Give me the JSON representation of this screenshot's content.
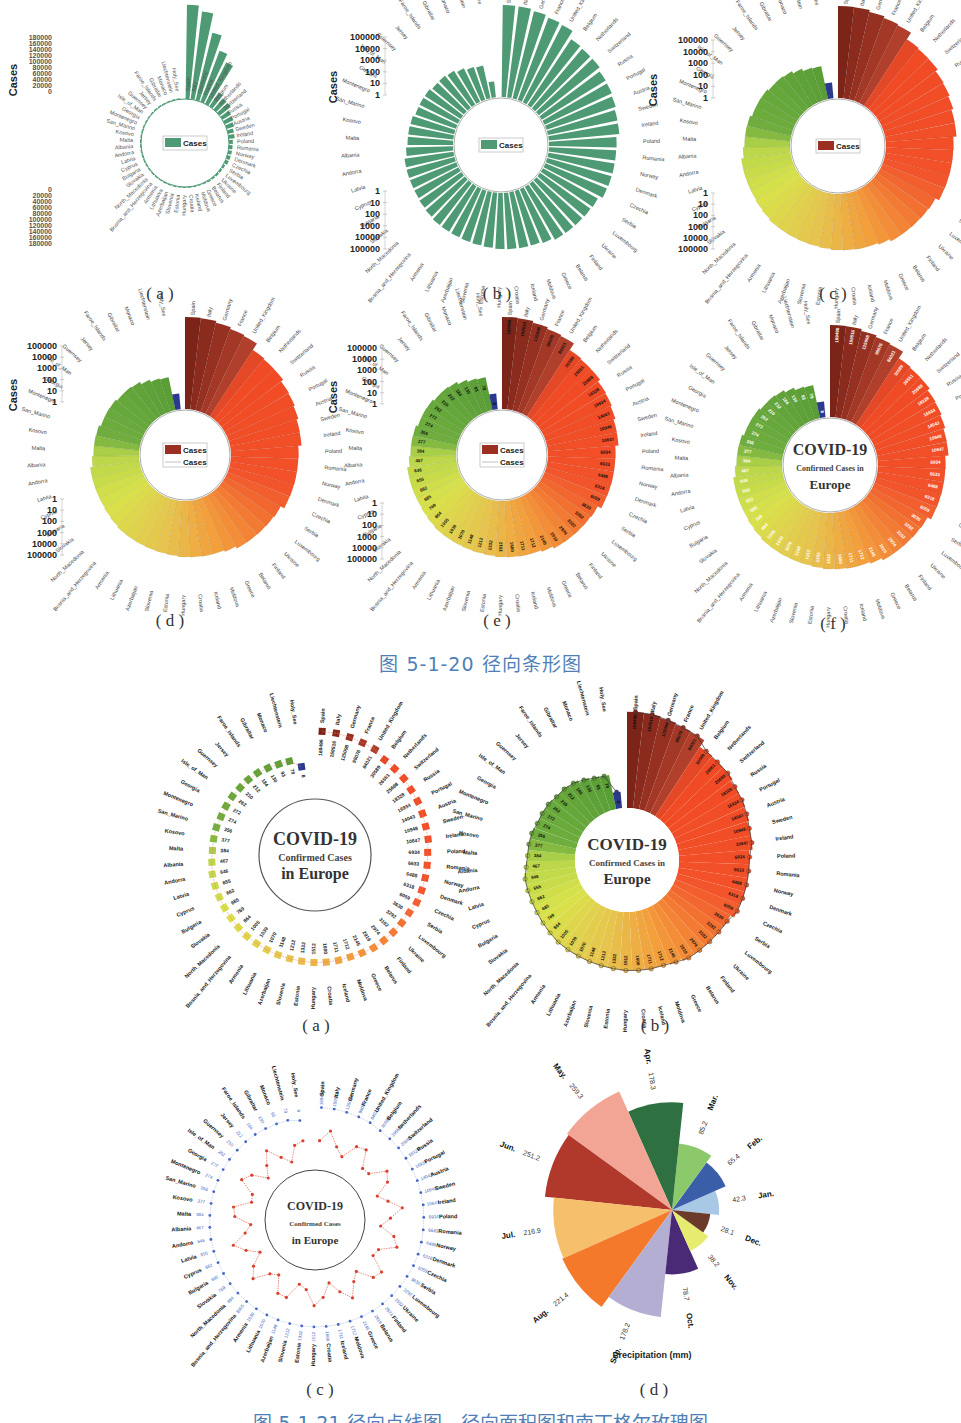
{
  "figure1": {
    "caption": "图 5-1-20    径向条形图",
    "sublabels": [
      "( a )",
      "( b )",
      "( c )",
      "( d )",
      "( e )",
      "( f )"
    ],
    "y_axis_label": "Cases",
    "legend_label": "Cases",
    "center_title": [
      "COVID-19",
      "Confirmed Cases in",
      "Europe"
    ]
  },
  "figure2": {
    "caption": "图 5-1-21    径向点线图、径向面积图和南丁格尔玫瑰图",
    "sublabels": [
      "( a )",
      "( b )",
      "( c )",
      "( d )"
    ],
    "center_title": [
      "COVID-19",
      "Confirmed Cases",
      "in Europe"
    ]
  },
  "chart_data": [
    {
      "id": "fig1a",
      "type": "bar",
      "subtype": "radial-bar-linear",
      "title": "",
      "ylabel": "Cases",
      "yticks": [
        0,
        20000,
        40000,
        60000,
        80000,
        100000,
        120000,
        140000,
        160000,
        180000
      ],
      "ylim": [
        0,
        180000
      ],
      "legend": [
        "Cases"
      ],
      "color": "#4e9a74",
      "categories": [
        "Spain",
        "Italy",
        "Germany",
        "France",
        "United_Kingdom",
        "Belgium",
        "Netherlands",
        "Switzerland",
        "Russia",
        "Portugal",
        "Austria",
        "Sweden",
        "Ireland",
        "Poland",
        "Romania",
        "Norway",
        "Denmark",
        "Czechia",
        "Serbia",
        "Luxembourg",
        "Ukraine",
        "Finland",
        "Belarus",
        "Greece",
        "Moldova",
        "Iceland",
        "Croatia",
        "Hungary",
        "Estonia",
        "Slovenia",
        "Azerbaijan",
        "Lithuania",
        "Armenia",
        "Bosnia_and_Herzegovina",
        "North_Macedonia",
        "Slovakia",
        "Bulgaria",
        "Cyprus",
        "Latvia",
        "Andorra",
        "Albania",
        "Malta",
        "Kosovo",
        "San_Marino",
        "Montenegro",
        "Georgia",
        "Isle_of_Man",
        "Guernsey",
        "Jersey",
        "Faroe_Islands",
        "Gibraltar",
        "Monaco",
        "Liechtenstein",
        "Holy_See"
      ],
      "values": [
        169496,
        159516,
        125098,
        98076,
        84021,
        30589,
        26551,
        25688,
        18328,
        16934,
        14043,
        10948,
        10647,
        6934,
        6633,
        6488,
        6318,
        6059,
        3630,
        3292,
        3102,
        2974,
        2919,
        2145,
        1712,
        1711,
        1600,
        1512,
        1332,
        1212,
        1148,
        1070,
        1039,
        1005,
        864,
        769,
        685,
        662,
        655,
        646,
        467,
        384,
        377,
        356,
        274,
        272,
        262,
        210,
        212,
        184,
        130,
        93,
        79,
        8
      ]
    },
    {
      "id": "fig1b",
      "type": "bar",
      "subtype": "radial-bar-log",
      "ylabel": "Cases",
      "yticks": [
        1,
        10,
        100,
        1000,
        10000,
        100000
      ],
      "scale": "log",
      "legend": [
        "Cases"
      ],
      "color": "#4e9a74",
      "note": "Same categories/values as fig1a on log scale, sorted descending clockwise from Spain to Holy_See"
    },
    {
      "id": "fig1c",
      "type": "bar",
      "subtype": "radial-bar-log-gradient",
      "ylabel": "Cases",
      "yticks": [
        1,
        10,
        100,
        1000,
        10000,
        100000
      ],
      "scale": "log",
      "legend": [
        "Cases"
      ],
      "colors": {
        "top": "#8b2a1e",
        "high": "#f04a24",
        "mid": "#e9c94a",
        "low": "#c6dd43",
        "lowest": "#5aa33a",
        "holy_see": "#2b3a8f"
      }
    },
    {
      "id": "fig1d",
      "type": "bar",
      "subtype": "radial-bar-log-gradient-with-line",
      "ylabel": "Cases",
      "yticks": [
        1,
        10,
        100,
        1000,
        10000,
        100000
      ],
      "legend": [
        "Cases",
        "Cases"
      ]
    },
    {
      "id": "fig1e",
      "type": "bar",
      "subtype": "radial-bar-log-gradient-with-labels",
      "ylabel": "Cases",
      "yticks": [
        1,
        10,
        100,
        1000,
        10000,
        100000
      ],
      "legend": [
        "Cases",
        "Cases"
      ]
    },
    {
      "id": "fig1f",
      "type": "bar",
      "subtype": "radial-bar-log-gradient-titled",
      "title": "COVID-19 Confirmed Cases in Europe"
    },
    {
      "id": "fig2a",
      "type": "scatter",
      "subtype": "radial-dot-line",
      "title": "COVID-19 Confirmed Cases in Europe"
    },
    {
      "id": "fig2b",
      "type": "area",
      "subtype": "radial-area",
      "title": "COVID-19 Confirmed Cases in Europe"
    },
    {
      "id": "fig2c",
      "type": "line",
      "subtype": "radial-dual-line",
      "title": "COVID-19 Confirmed Cases in Europe",
      "series": [
        {
          "name": "cases-outer",
          "color": "#3b5fc0"
        },
        {
          "name": "cases-inner",
          "color": "#d9412e"
        }
      ]
    },
    {
      "id": "fig2d",
      "type": "pie",
      "subtype": "nightingale-rose",
      "title": "",
      "xlabel": "Precipitation (mm)",
      "categories": [
        "Jan.",
        "Feb.",
        "Mar.",
        "Apr.",
        "May.",
        "Jun.",
        "Jul.",
        "Aug.",
        "Sep.",
        "Oct.",
        "Nov.",
        "Dec."
      ],
      "values": [
        42.3,
        65.4,
        85.2,
        178.3,
        259.3,
        251.2,
        216.9,
        221.4,
        178.2,
        78.7,
        38.2,
        28.1
      ],
      "colors": [
        "#a9c8e6",
        "#3a5ea8",
        "#8cc96b",
        "#2f7040",
        "#f2a594",
        "#b0392c",
        "#f5bf6b",
        "#f5792b",
        "#b4aed2",
        "#4a2a76",
        "#e6ed6e",
        "#6b3a2a"
      ]
    }
  ]
}
